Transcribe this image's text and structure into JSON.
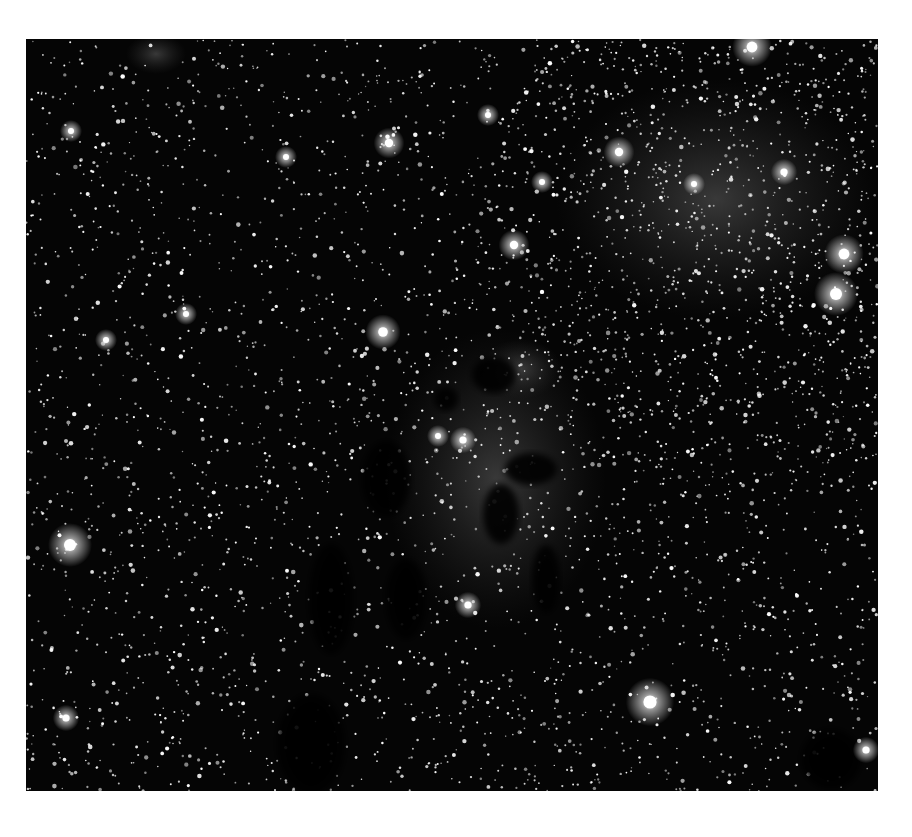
{
  "image": {
    "subject": "Grayscale astronomical photograph of a dense star field with dark dust pillars and faint nebulosity",
    "frame": {
      "x": 26,
      "y": 39,
      "width": 852,
      "height": 752
    },
    "colors": {
      "page_background": "#ffffff",
      "sky_background": "#050505",
      "nebula_glow": "#3a3a3a",
      "dust_pillar": "#020202",
      "star": "#ffffff"
    },
    "bright_stars": [
      {
        "x": 726,
        "y": 8,
        "r": 9
      },
      {
        "x": 363,
        "y": 104,
        "r": 7
      },
      {
        "x": 593,
        "y": 113,
        "r": 7
      },
      {
        "x": 758,
        "y": 133,
        "r": 6
      },
      {
        "x": 488,
        "y": 206,
        "r": 7
      },
      {
        "x": 818,
        "y": 215,
        "r": 9
      },
      {
        "x": 810,
        "y": 255,
        "r": 10
      },
      {
        "x": 357,
        "y": 293,
        "r": 8
      },
      {
        "x": 44,
        "y": 506,
        "r": 10
      },
      {
        "x": 624,
        "y": 663,
        "r": 11
      },
      {
        "x": 40,
        "y": 679,
        "r": 6
      },
      {
        "x": 260,
        "y": 118,
        "r": 5
      },
      {
        "x": 462,
        "y": 76,
        "r": 5
      },
      {
        "x": 516,
        "y": 143,
        "r": 5
      },
      {
        "x": 437,
        "y": 401,
        "r": 6
      },
      {
        "x": 412,
        "y": 397,
        "r": 5
      },
      {
        "x": 442,
        "y": 566,
        "r": 6
      },
      {
        "x": 160,
        "y": 275,
        "r": 5
      },
      {
        "x": 80,
        "y": 301,
        "r": 5
      },
      {
        "x": 840,
        "y": 711,
        "r": 6
      },
      {
        "x": 45,
        "y": 92,
        "r": 5
      },
      {
        "x": 668,
        "y": 145,
        "r": 5
      }
    ],
    "dust_pillars": [
      {
        "cx": 468,
        "cy": 336,
        "rx": 22,
        "ry": 18
      },
      {
        "cx": 505,
        "cy": 430,
        "rx": 26,
        "ry": 16
      },
      {
        "cx": 475,
        "cy": 475,
        "rx": 18,
        "ry": 30
      },
      {
        "cx": 520,
        "cy": 540,
        "rx": 14,
        "ry": 34
      },
      {
        "cx": 360,
        "cy": 440,
        "rx": 24,
        "ry": 38
      },
      {
        "cx": 305,
        "cy": 560,
        "rx": 22,
        "ry": 55
      },
      {
        "cx": 380,
        "cy": 560,
        "rx": 20,
        "ry": 40
      },
      {
        "cx": 285,
        "cy": 705,
        "rx": 34,
        "ry": 50
      },
      {
        "cx": 805,
        "cy": 720,
        "rx": 30,
        "ry": 30
      },
      {
        "cx": 420,
        "cy": 360,
        "rx": 12,
        "ry": 12
      }
    ],
    "nebula_glows": [
      {
        "cx": 470,
        "cy": 440,
        "rx": 110,
        "ry": 150
      },
      {
        "cx": 495,
        "cy": 330,
        "rx": 40,
        "ry": 30
      },
      {
        "cx": 130,
        "cy": 15,
        "rx": 30,
        "ry": 20
      },
      {
        "cx": 690,
        "cy": 160,
        "rx": 160,
        "ry": 120
      }
    ],
    "star_field": {
      "count": 3200,
      "seed": 42,
      "dense_region": {
        "cx": 700,
        "cy": 200,
        "rx": 260,
        "ry": 260,
        "extra": 900
      }
    }
  }
}
